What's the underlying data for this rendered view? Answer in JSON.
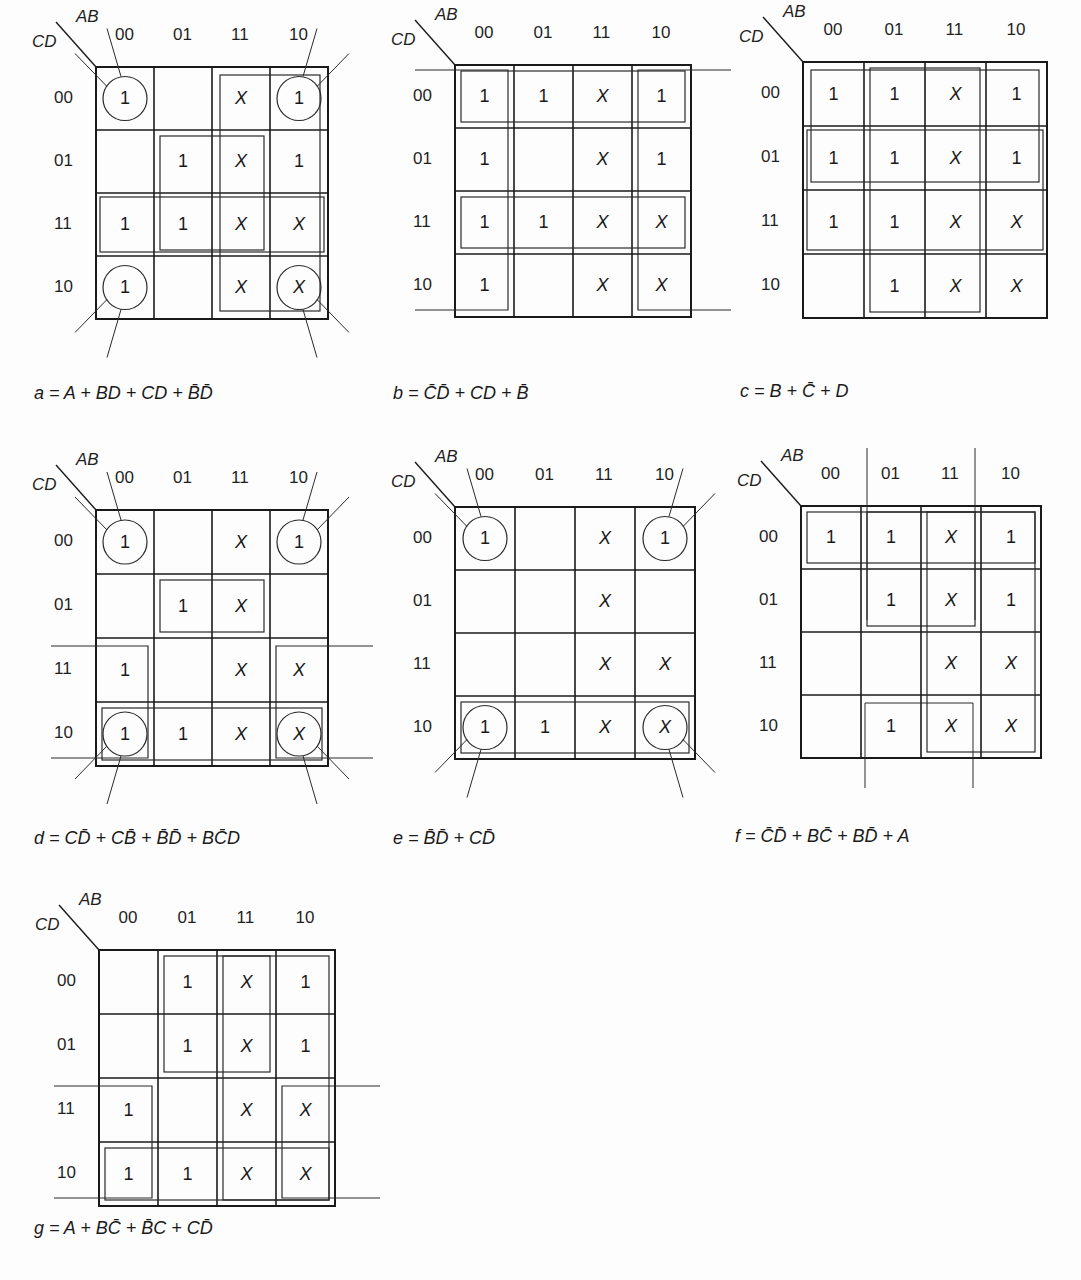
{
  "figure": {
    "row_header": "CD",
    "col_header": "AB",
    "col_labels": [
      "00",
      "01",
      "11",
      "10"
    ],
    "row_labels": [
      "00",
      "01",
      "11",
      "10"
    ],
    "maps": [
      {
        "id": "a",
        "cells": [
          [
            "1",
            "",
            "X",
            "1"
          ],
          [
            "",
            "1",
            "X",
            "1"
          ],
          [
            "1",
            "1",
            "X",
            "X"
          ],
          [
            "1",
            "",
            "X",
            "X"
          ]
        ],
        "expression": "a = A + BD + CD + B̄D̄"
      },
      {
        "id": "b",
        "cells": [
          [
            "1",
            "1",
            "X",
            "1"
          ],
          [
            "1",
            "",
            "X",
            "1"
          ],
          [
            "1",
            "1",
            "X",
            "X"
          ],
          [
            "1",
            "",
            "X",
            "X"
          ]
        ],
        "expression": "b = C̄D̄ + CD + B̄"
      },
      {
        "id": "c",
        "cells": [
          [
            "1",
            "1",
            "X",
            "1"
          ],
          [
            "1",
            "1",
            "X",
            "1"
          ],
          [
            "1",
            "1",
            "X",
            "X"
          ],
          [
            "",
            "1",
            "X",
            "X"
          ]
        ],
        "expression": "c = B + C̄ + D"
      },
      {
        "id": "d",
        "cells": [
          [
            "1",
            "",
            "X",
            "1"
          ],
          [
            "",
            "1",
            "X",
            ""
          ],
          [
            "1",
            "",
            "X",
            "X"
          ],
          [
            "1",
            "1",
            "X",
            "X"
          ]
        ],
        "expression": "d = CD̄ + CB̄ + B̄D̄ + BC̄D"
      },
      {
        "id": "e",
        "cells": [
          [
            "1",
            "",
            "X",
            "1"
          ],
          [
            "",
            "",
            "X",
            ""
          ],
          [
            "",
            "",
            "X",
            "X"
          ],
          [
            "1",
            "1",
            "X",
            "X"
          ]
        ],
        "expression": "e = B̄D̄ + CD̄"
      },
      {
        "id": "f",
        "cells": [
          [
            "1",
            "1",
            "X",
            "1"
          ],
          [
            "",
            "1",
            "X",
            "1"
          ],
          [
            "",
            "",
            "X",
            "X"
          ],
          [
            "",
            "1",
            "X",
            "X"
          ]
        ],
        "expression": "f = C̄D̄ + BC̄ + BD̄ + A"
      },
      {
        "id": "g",
        "cells": [
          [
            "",
            "1",
            "X",
            "1"
          ],
          [
            "",
            "1",
            "X",
            "1"
          ],
          [
            "1",
            "",
            "X",
            "X"
          ],
          [
            "1",
            "1",
            "X",
            "X"
          ]
        ],
        "expression": "g = A + BC̄ + B̄C + CD̄"
      }
    ]
  }
}
